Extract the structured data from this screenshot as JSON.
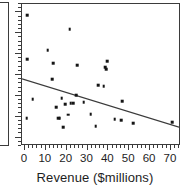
{
  "chart_data": {
    "type": "scatter",
    "title": "",
    "xlabel": "Revenue ($millions)",
    "ylabel": "",
    "xlim": [
      -1.4,
      74.8
    ],
    "ylim": [
      0,
      100
    ],
    "grid": false,
    "legend": null,
    "x_ticks": [
      0,
      10,
      20,
      30,
      40,
      50,
      60,
      70
    ],
    "x_tick_labels": [
      "0",
      "10",
      "20",
      "30",
      "40",
      "50",
      "60",
      "70"
    ],
    "y_ticks": [],
    "y_tick_labels": [],
    "point_color": "#151515",
    "line_color": "#3b3b3b",
    "frame_color": "#3b3b3b",
    "points": [
      {
        "x": 1.0,
        "y": 92.2
      },
      {
        "x": 21.5,
        "y": 82.4
      },
      {
        "x": 11.0,
        "y": 67.6
      },
      {
        "x": 1.0,
        "y": 61.3
      },
      {
        "x": 13.6,
        "y": 58.5
      },
      {
        "x": 25.0,
        "y": 57.0
      },
      {
        "x": 39.5,
        "y": 59.9
      },
      {
        "x": 38.4,
        "y": 55.6
      },
      {
        "x": 39.0,
        "y": 54.2
      },
      {
        "x": 13.0,
        "y": 47.2
      },
      {
        "x": 35.2,
        "y": 43.0
      },
      {
        "x": 37.8,
        "y": 42.3
      },
      {
        "x": 3.8,
        "y": 33.1
      },
      {
        "x": 17.6,
        "y": 33.8
      },
      {
        "x": 22.0,
        "y": 30.3
      },
      {
        "x": 23.2,
        "y": 30.3
      },
      {
        "x": 28.2,
        "y": 31.0
      },
      {
        "x": 46.6,
        "y": 31.7
      },
      {
        "x": 15.0,
        "y": 27.5
      },
      {
        "x": 20.6,
        "y": 21.9
      },
      {
        "x": 16.0,
        "y": 19.7
      },
      {
        "x": 16.6,
        "y": 19.7
      },
      {
        "x": 31.5,
        "y": 22.6
      },
      {
        "x": 0.8,
        "y": 19.7
      },
      {
        "x": 43.0,
        "y": 19.0
      },
      {
        "x": 46.2,
        "y": 18.3
      },
      {
        "x": 51.8,
        "y": 16.2
      },
      {
        "x": 70.6,
        "y": 16.9
      },
      {
        "x": 18.4,
        "y": 13.4
      },
      {
        "x": 34.0,
        "y": 14.1
      },
      {
        "x": 24.6,
        "y": 35.9
      },
      {
        "x": 19.2,
        "y": 29.6
      }
    ],
    "fit_line": {
      "type": "linear-fit",
      "x_start": -1.4,
      "y_start": 46.5,
      "x_end": 74.8,
      "y_end": 12.0
    }
  },
  "axis": {
    "x_title": "Revenue ($millions)"
  }
}
